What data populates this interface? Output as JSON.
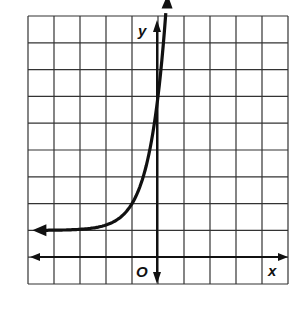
{
  "chart_data": {
    "type": "line",
    "title": "",
    "xlabel": "x",
    "ylabel": "y",
    "origin_label": "O",
    "grid": true,
    "xlim": [
      -5,
      5
    ],
    "ylim": [
      -1,
      9
    ],
    "asymptote": 1,
    "y_intercept": 6,
    "equation_estimate": "y = 5^(x+1) + 1",
    "series": [
      {
        "name": "exponential curve",
        "x": [
          -5,
          -4,
          -3,
          -2,
          -1,
          0,
          0.3
        ],
        "y": [
          1.0,
          1.01,
          1.04,
          1.2,
          2,
          6,
          9
        ]
      }
    ]
  },
  "colors": {
    "grid": "#333333",
    "curve": "#111111",
    "background": "#ffffff"
  }
}
